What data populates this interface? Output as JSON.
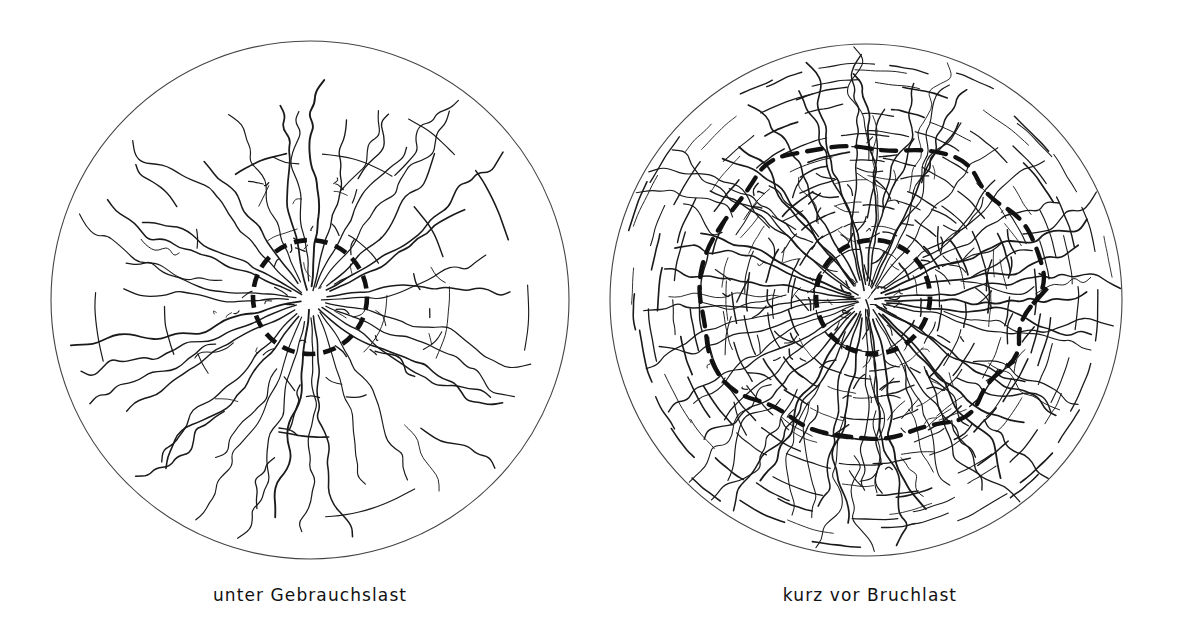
{
  "figure": {
    "background_color": "#ffffff",
    "ink_color": "#1a1a1a",
    "width": 1181,
    "height": 633
  },
  "panels": [
    {
      "id": "left",
      "caption": "unter Gebrauchslast",
      "caption_center_x": 310,
      "caption_y": 600,
      "slab": {
        "shape": "circle",
        "cx": 310,
        "cy": 300,
        "r": 259,
        "stroke_width": 1.1,
        "stroke": "#444444",
        "dashed": false
      },
      "inner_zone": {
        "shape": "circle",
        "cx": 310,
        "cy": 297,
        "r": 57,
        "stroke_width": 4.6,
        "stroke": "#111111",
        "dashed": true,
        "dash_pattern": "13 8"
      },
      "outer_zone": null,
      "crack_density": "moderate",
      "radial_crack_count": 34,
      "ring_crack_count": 3,
      "crack_extent_ratio": 0.96,
      "crack_style": "predominantly radial cracks fanning from centre, few circumferential links"
    },
    {
      "id": "right",
      "caption": "kurz vor Bruchlast",
      "caption_center_x": 870,
      "caption_y": 600,
      "slab": {
        "shape": "circle",
        "cx": 866,
        "cy": 300,
        "r": 256,
        "stroke_width": 1.1,
        "stroke": "#444444",
        "dashed": false
      },
      "inner_zone": {
        "shape": "circle",
        "cx": 873,
        "cy": 297,
        "r": 57,
        "stroke_width": 4.8,
        "stroke": "#111111",
        "dashed": true,
        "dash_pattern": "13 8"
      },
      "outer_zone": {
        "shape": "irregular-polygon",
        "cx": 868,
        "cy": 288,
        "r": 168,
        "stroke_width": 4.4,
        "stroke": "#111111",
        "dashed": true,
        "dash_pattern": "15 10"
      },
      "crack_density": "very high",
      "radial_crack_count": 46,
      "ring_crack_count": 9,
      "crack_extent_ratio": 0.99,
      "crack_style": "dense radial plus many circumferential cracks forming closed mesh"
    }
  ],
  "captions": {
    "left": "unter Gebrauchslast",
    "right": "kurz vor Bruchlast"
  }
}
